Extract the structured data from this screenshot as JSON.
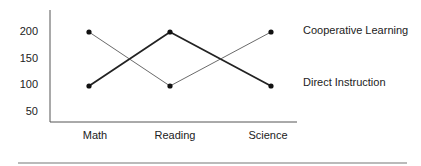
{
  "chart_data": {
    "type": "line",
    "title": "",
    "xlabel": "",
    "ylabel": "",
    "categories": [
      "Math",
      "Reading",
      "Science"
    ],
    "y_ticks": [
      50,
      100,
      150,
      200
    ],
    "ylim": [
      30,
      240
    ],
    "grid": false,
    "legend_position": "right (labels placed at line ends)",
    "series": [
      {
        "name": "Cooperative Learning",
        "values": [
          100,
          200,
          100
        ],
        "line_weight": "thick"
      },
      {
        "name": "Direct Instruction",
        "values": [
          200,
          100,
          200
        ],
        "line_weight": "thin"
      }
    ],
    "labels": {
      "legend_top": "Cooperative Learning",
      "legend_bottom": "Direct Instruction"
    }
  },
  "colors": {
    "axis": "#555555",
    "line": "#222222",
    "marker": "#111111",
    "rule": "#777777"
  }
}
